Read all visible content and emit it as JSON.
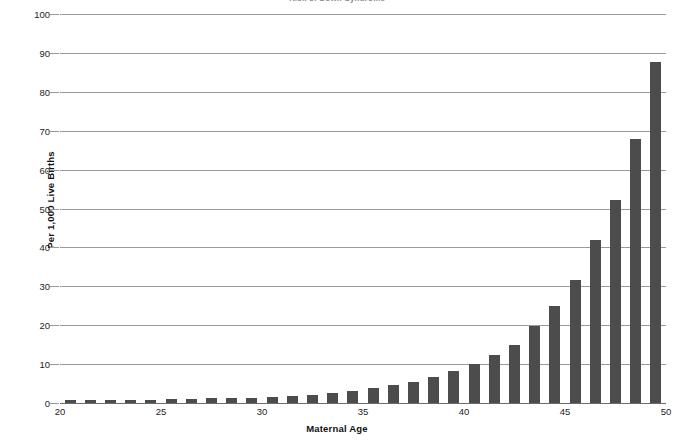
{
  "chart_data": {
    "type": "bar",
    "title": "Risk of Down Syndrome",
    "xlabel": "Maternal Age",
    "ylabel": "Per 1,000 Live Births",
    "xlim": [
      20,
      50
    ],
    "ylim": [
      0,
      100
    ],
    "ytick_step": 10,
    "grid": true,
    "legend": "none",
    "bar_color": "#4c4c4c",
    "gridline_color": "#9a9a9a",
    "axis_color": "#6b6b6b",
    "categories": [
      20,
      21,
      22,
      23,
      24,
      25,
      26,
      27,
      28,
      29,
      30,
      31,
      32,
      33,
      34,
      35,
      36,
      37,
      38,
      39,
      40,
      41,
      42,
      43,
      44,
      45,
      46,
      47,
      48,
      49
    ],
    "values": [
      0.7,
      0.7,
      0.8,
      0.8,
      0.9,
      1.0,
      1.1,
      1.2,
      1.3,
      1.4,
      1.6,
      1.8,
      2.1,
      2.5,
      3.1,
      3.8,
      4.6,
      5.5,
      6.8,
      8.3,
      10.1,
      12.3,
      15.0,
      19.9,
      25.0,
      31.7,
      41.9,
      52.3,
      67.8,
      87.7
    ],
    "yticks": [
      "0",
      "10",
      "20",
      "30",
      "40",
      "50",
      "60",
      "70",
      "80",
      "90",
      "100"
    ],
    "xticks": [
      "20",
      "25",
      "30",
      "35",
      "40",
      "45",
      "50"
    ]
  }
}
